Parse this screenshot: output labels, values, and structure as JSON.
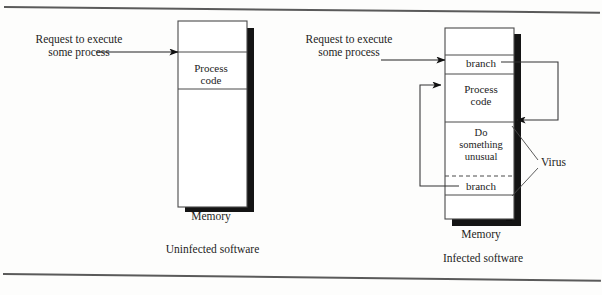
{
  "figure": {
    "type": "diagram"
  },
  "left_panel": {
    "name": "uninfected",
    "request_label": {
      "line1": "Request to execute",
      "line2": "some process"
    },
    "memory_caption": "Memory",
    "caption": "Uninfected software",
    "blocks": [
      {
        "label": "",
        "kind": "empty"
      },
      {
        "label": "Process code",
        "label_line1": "Process",
        "label_line2": "code",
        "kind": "process"
      },
      {
        "label": "",
        "kind": "empty"
      }
    ]
  },
  "right_panel": {
    "name": "infected",
    "request_label": {
      "line1": "Request to execute",
      "line2": "some process"
    },
    "memory_caption": "Memory",
    "caption": "Infected software",
    "virus_label": "Virus",
    "blocks": [
      {
        "label": "",
        "kind": "empty"
      },
      {
        "label": "branch",
        "kind": "branch"
      },
      {
        "label": "Process code",
        "label_line1": "Process",
        "label_line2": "code",
        "kind": "process"
      },
      {
        "label": "Do something unusual",
        "label_line1": "Do",
        "label_line2": "something",
        "label_line3": "unusual",
        "kind": "virus-payload"
      },
      {
        "label": "branch",
        "kind": "branch"
      },
      {
        "label": "",
        "kind": "empty"
      }
    ]
  },
  "colors": {
    "ink": "#1d1d1d",
    "line": "#4a4a4a",
    "shadow": "#141414",
    "paper": "#fdfdfc"
  }
}
